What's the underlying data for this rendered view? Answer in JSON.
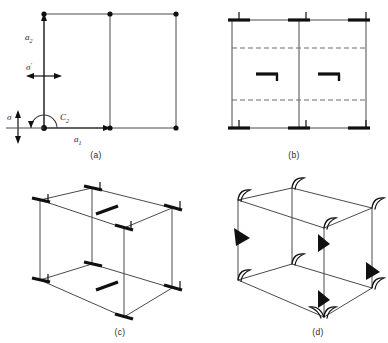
{
  "figure": {
    "panel_count": 4,
    "background_color": "#ffffff",
    "ink_color": "#101010"
  },
  "panels": [
    {
      "id": "a",
      "caption": "(a)",
      "type": "2d-lattice-net",
      "description": "Rectangular plane lattice with basis vectors, mirror lines and a two-fold rotation axis",
      "labels": [
        {
          "name": "a2-vector",
          "base": "a",
          "sub": "2",
          "meaning": "second lattice basis vector, vertical"
        },
        {
          "name": "a1-vector",
          "base": "a",
          "sub": "1",
          "meaning": "first lattice basis vector, horizontal"
        },
        {
          "name": "sigma-prime",
          "base": "σ",
          "sub": "′",
          "meaning": "mirror plane perpendicular to a1"
        },
        {
          "name": "sigma",
          "base": "σ",
          "sub": "",
          "meaning": "mirror plane perpendicular to a2"
        },
        {
          "name": "c2-axis",
          "base": "C",
          "sub": "2",
          "meaning": "two-fold rotation axis"
        }
      ],
      "lattice_points_top": 3,
      "lattice_points_bottom": 3,
      "grid_columns": 2,
      "grid_rows": 1
    },
    {
      "id": "b",
      "caption": "(b)",
      "type": "2d-symmetry-diagram",
      "description": "Unit mesh outline carrying mirror bars at the edges, dashed glide lines and two-fold axis symbols",
      "mirror_bar_positions": [
        "top-left",
        "top-center",
        "top-right",
        "bottom-left",
        "bottom-center",
        "bottom-right"
      ],
      "glide_lines": 2,
      "glide_line_style": "dashed",
      "two_fold_symbols": 2,
      "vertical_dividers": 1
    },
    {
      "id": "c",
      "caption": "(c)",
      "type": "3d-cell-isometric",
      "description": "Isometric unit cell with mirror bars at every vertex and two-fold axis symbols on top and bottom faces",
      "vertices": 8,
      "vertex_symbol": "mirror-bar",
      "face_symbols": 2,
      "face_symbol_type": "two-fold-axis"
    },
    {
      "id": "d",
      "caption": "(d)",
      "type": "3d-cell-isometric",
      "description": "Isometric unit cell with curved hook symbols at the vertices and filled triangular arrowheads on the edges",
      "vertices": 8,
      "vertex_symbol": "curved-hook",
      "arrowheads": 4,
      "arrowhead_style": "solid-triangle"
    }
  ]
}
